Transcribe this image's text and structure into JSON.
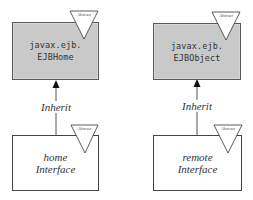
{
  "diagram": {
    "type": "class-inheritance",
    "columns": [
      {
        "parent": {
          "lines": [
            "javax.ejb.",
            "EJBHome"
          ],
          "style": "gray",
          "badge": "Abstract"
        },
        "relation": "Inherit",
        "child": {
          "lines": [
            "home",
            "Interface"
          ],
          "style": "white",
          "badge": "Abstract"
        }
      },
      {
        "parent": {
          "lines": [
            "javax.ejb.",
            "EJBObject"
          ],
          "style": "gray",
          "badge": "Abstract"
        },
        "relation": "Inherit",
        "child": {
          "lines": [
            "remote",
            "Interface"
          ],
          "style": "white",
          "badge": "Abstract"
        }
      }
    ],
    "colors": {
      "parent_fill": "#c9c9c9",
      "child_fill": "#ffffff",
      "stroke": "#444444",
      "text": "#333333"
    }
  }
}
